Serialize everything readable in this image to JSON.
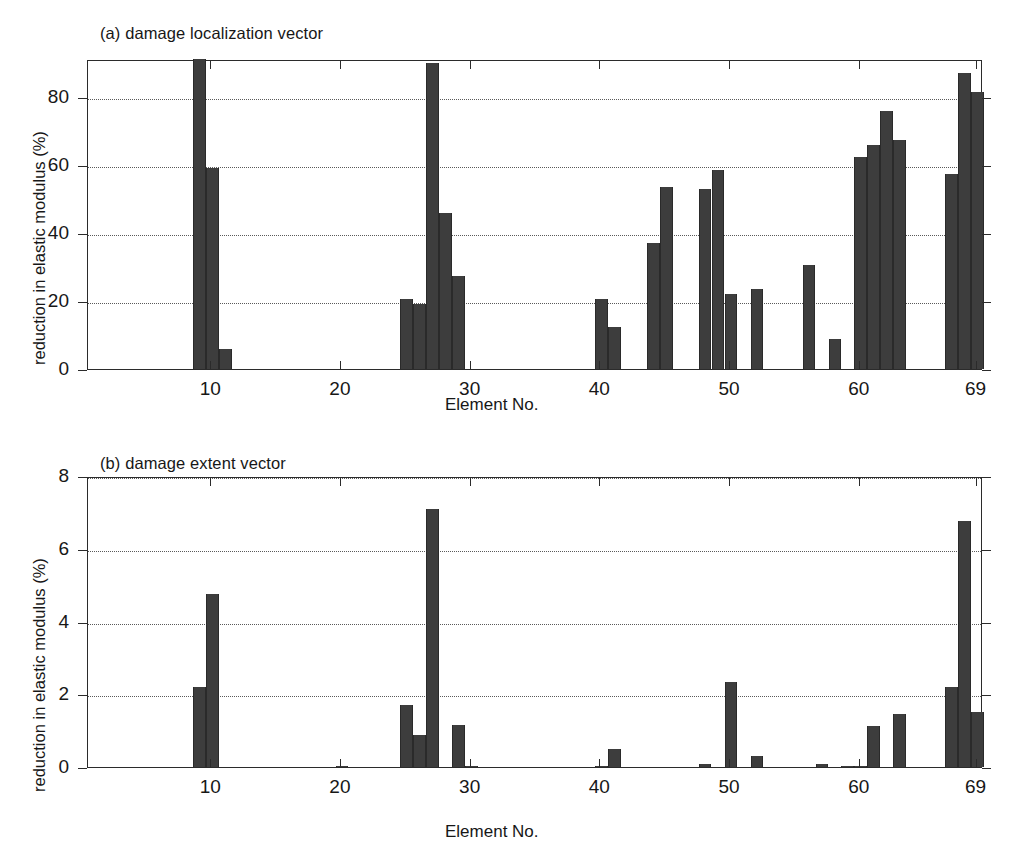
{
  "figure": {
    "panel_a_title": "(a) damage localization vector",
    "panel_b_title": "(b) damage extent vector",
    "ylabel": "reduction in elastic modulus (%)",
    "xlabel": "Element No.",
    "bar_color": "#3d3d3d",
    "axis_color": "#2b2b2b",
    "grid_color": "#5a5a5a",
    "background": "#ffffff"
  },
  "chart_data": [
    {
      "type": "bar",
      "title": "(a) damage localization vector",
      "xlabel": "Element No.",
      "ylabel": "reduction in elastic modulus (%)",
      "xlim": [
        1,
        69
      ],
      "ylim": [
        0,
        91.2
      ],
      "grid": true,
      "legend": "none",
      "xticks": [
        10,
        20,
        30,
        40,
        50,
        60,
        69
      ],
      "xticklabels": [
        "10",
        "20",
        "30",
        "40",
        "50",
        "60",
        "69"
      ],
      "yticks": [
        0,
        20,
        40,
        60,
        80
      ],
      "yticklabels": [
        "0",
        "20",
        "40",
        "60",
        "80"
      ],
      "x": [
        1,
        2,
        3,
        4,
        5,
        6,
        7,
        8,
        9,
        10,
        11,
        12,
        13,
        14,
        15,
        16,
        17,
        18,
        19,
        20,
        21,
        22,
        23,
        24,
        25,
        26,
        27,
        28,
        29,
        30,
        31,
        32,
        33,
        34,
        35,
        36,
        37,
        38,
        39,
        40,
        41,
        42,
        43,
        44,
        45,
        46,
        47,
        48,
        49,
        50,
        51,
        52,
        53,
        54,
        55,
        56,
        57,
        58,
        59,
        60,
        61,
        62,
        63,
        64,
        65,
        66,
        67,
        68,
        69
      ],
      "values": [
        0,
        0,
        0,
        0,
        0,
        0,
        0,
        0,
        95,
        59,
        6,
        0,
        0,
        0,
        0,
        0,
        0,
        0,
        0,
        0,
        0,
        0,
        0,
        0,
        20.5,
        19.2,
        90,
        46,
        27.5,
        0,
        0,
        0,
        0,
        0,
        0,
        0,
        0,
        0,
        0,
        20.5,
        12.5,
        0,
        0,
        37,
        53.5,
        0,
        0,
        53,
        58.5,
        22,
        0,
        23.5,
        0,
        0,
        0,
        30.5,
        0,
        8.7,
        0,
        62.5,
        66,
        76,
        67.5,
        0,
        0,
        0,
        57.5,
        87,
        81.5
      ]
    },
    {
      "type": "bar",
      "title": "(b) damage extent vector",
      "xlabel": "Element No.",
      "ylabel": "reduction in elastic modulus (%)",
      "xlim": [
        1,
        69
      ],
      "ylim": [
        0,
        8
      ],
      "grid": true,
      "legend": "none",
      "xticks": [
        10,
        20,
        30,
        40,
        50,
        60,
        69
      ],
      "xticklabels": [
        "10",
        "20",
        "30",
        "40",
        "50",
        "60",
        "69"
      ],
      "yticks": [
        0,
        2,
        4,
        6,
        8
      ],
      "yticklabels": [
        "0",
        "2",
        "4",
        "6",
        "8"
      ],
      "x": [
        1,
        2,
        3,
        4,
        5,
        6,
        7,
        8,
        9,
        10,
        11,
        12,
        13,
        14,
        15,
        16,
        17,
        18,
        19,
        20,
        21,
        22,
        23,
        24,
        25,
        26,
        27,
        28,
        29,
        30,
        31,
        32,
        33,
        34,
        35,
        36,
        37,
        38,
        39,
        40,
        41,
        42,
        43,
        44,
        45,
        46,
        47,
        48,
        49,
        50,
        51,
        52,
        53,
        54,
        55,
        56,
        57,
        58,
        59,
        60,
        61,
        62,
        63,
        64,
        65,
        66,
        67,
        68,
        69
      ],
      "values": [
        0,
        0,
        0,
        0,
        0,
        0,
        0,
        0,
        2.2,
        4.75,
        0,
        0,
        0,
        0,
        0,
        0,
        0,
        0,
        0,
        0.03,
        0,
        0,
        0,
        0,
        1.7,
        0.88,
        7.1,
        0,
        1.15,
        0.03,
        0,
        0,
        0,
        0,
        0,
        0,
        0,
        0,
        0,
        0.04,
        0.5,
        0,
        0,
        0,
        0,
        0,
        0,
        0.08,
        0,
        2.33,
        0,
        0.3,
        0,
        0,
        0,
        0,
        0.07,
        0,
        0.04,
        0.03,
        1.12,
        0,
        1.47,
        0,
        0,
        0,
        2.2,
        6.75,
        1.5
      ]
    }
  ]
}
